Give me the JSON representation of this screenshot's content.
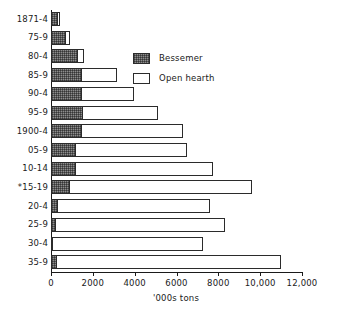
{
  "chart_data": {
    "type": "bar",
    "orientation": "horizontal",
    "stacked": true,
    "title": "",
    "xlabel": "'000s tons",
    "ylabel": "",
    "xlim": [
      0,
      12000
    ],
    "xticks": [
      0,
      2000,
      4000,
      6000,
      8000,
      10000,
      12000
    ],
    "xticklabels": [
      "0",
      "2000",
      "4000",
      "6000",
      "8000",
      "10,000",
      "12,000"
    ],
    "grid": false,
    "legend_position": "upper right inside",
    "categories": [
      "1871-4",
      "75-9",
      "80-4",
      "85-9",
      "90-4",
      "95-9",
      "1900-4",
      "05-9",
      "10-14",
      "*15-19",
      "20-4",
      "25-9",
      "30-4",
      "35-9"
    ],
    "series": [
      {
        "name": "Bessemer",
        "color": "#8d8d8d",
        "values": [
          330,
          700,
          1280,
          1500,
          1500,
          1520,
          1500,
          1200,
          1200,
          900,
          340,
          250,
          60,
          290
        ]
      },
      {
        "name": "Open hearth",
        "color": "#ffffff",
        "values": [
          110,
          190,
          300,
          1650,
          2480,
          3600,
          4800,
          5300,
          6550,
          8730,
          7280,
          8050,
          7200,
          10700
        ]
      }
    ],
    "totals": [
      440,
      890,
      1580,
      3150,
      3980,
      5120,
      6300,
      6500,
      7750,
      9630,
      7620,
      8300,
      7260,
      10990
    ],
    "annotations": [
      "* denotes the period marked with an asterisk on the 15-19 category label"
    ]
  },
  "legend": {
    "items": [
      {
        "label": "Bessemer",
        "swatch": "hatched-dark-swatch"
      },
      {
        "label": "Open hearth",
        "swatch": "white-swatch"
      }
    ]
  }
}
